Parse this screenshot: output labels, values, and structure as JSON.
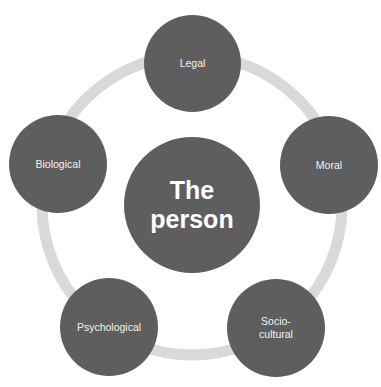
{
  "diagram": {
    "center": {
      "label": "The\nperson"
    },
    "nodes": [
      {
        "id": "legal",
        "label": "Legal"
      },
      {
        "id": "moral",
        "label": "Moral"
      },
      {
        "id": "socio-cultural",
        "label": "Socio-\ncultural"
      },
      {
        "id": "psychological",
        "label": "Psychological"
      },
      {
        "id": "biological",
        "label": "Biological"
      }
    ],
    "colors": {
      "node": "#5e5e5e",
      "ring": "#d9d9d9",
      "text": "#f2f2f2",
      "background": "#ffffff"
    }
  }
}
